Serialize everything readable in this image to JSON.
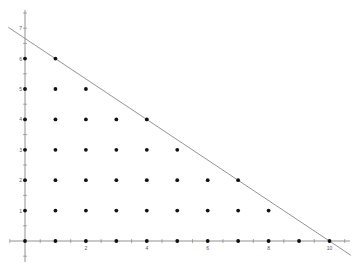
{
  "chart_data": {
    "type": "scatter",
    "title": "",
    "xlabel": "",
    "ylabel": "",
    "xlim": [
      -0.5,
      10.8
    ],
    "ylim": [
      -0.8,
      7.5
    ],
    "grid": false,
    "legend": null,
    "x_tick_labels": [
      "2",
      "4",
      "6",
      "8",
      "10"
    ],
    "y_tick_labels": [
      "1",
      "2",
      "3",
      "4",
      "5",
      "6",
      "7"
    ],
    "minor_ticks_step": 0.5,
    "series": [
      {
        "name": "lattice points",
        "points": [
          [
            0,
            0
          ],
          [
            1,
            0
          ],
          [
            2,
            0
          ],
          [
            3,
            0
          ],
          [
            4,
            0
          ],
          [
            5,
            0
          ],
          [
            6,
            0
          ],
          [
            7,
            0
          ],
          [
            8,
            0
          ],
          [
            9,
            0
          ],
          [
            10,
            0
          ],
          [
            0,
            1
          ],
          [
            1,
            1
          ],
          [
            2,
            1
          ],
          [
            3,
            1
          ],
          [
            4,
            1
          ],
          [
            5,
            1
          ],
          [
            6,
            1
          ],
          [
            7,
            1
          ],
          [
            8,
            1
          ],
          [
            0,
            2
          ],
          [
            1,
            2
          ],
          [
            2,
            2
          ],
          [
            3,
            2
          ],
          [
            4,
            2
          ],
          [
            5,
            2
          ],
          [
            6,
            2
          ],
          [
            7,
            2
          ],
          [
            0,
            3
          ],
          [
            1,
            3
          ],
          [
            2,
            3
          ],
          [
            3,
            3
          ],
          [
            4,
            3
          ],
          [
            5,
            3
          ],
          [
            0,
            4
          ],
          [
            1,
            4
          ],
          [
            2,
            4
          ],
          [
            3,
            4
          ],
          [
            4,
            4
          ],
          [
            0,
            5
          ],
          [
            1,
            5
          ],
          [
            2,
            5
          ],
          [
            0,
            6
          ],
          [
            1,
            6
          ]
        ],
        "color": "#111111"
      }
    ],
    "lines": [
      {
        "name": "boundary line",
        "equation": "2x + 3y = 20",
        "from": [
          -0.55,
          7.03
        ],
        "to": [
          10.7,
          -0.47
        ],
        "color": "#888888"
      }
    ]
  },
  "colors": {
    "axis": "#777777",
    "point": "#111111",
    "line": "#888888",
    "background": "#ffffff"
  }
}
